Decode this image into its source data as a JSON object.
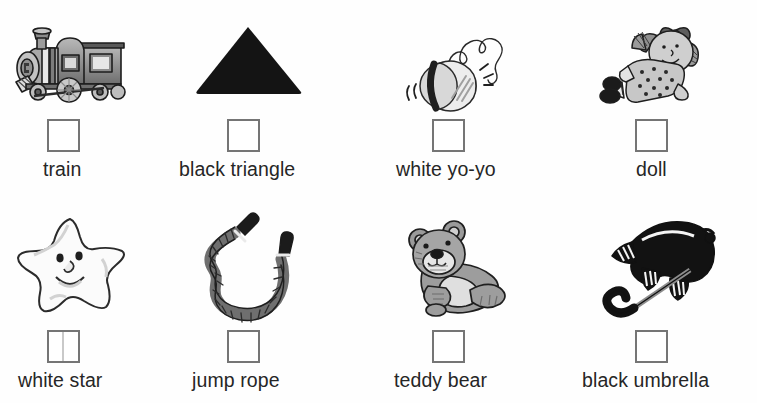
{
  "page": {
    "kind": "worksheet",
    "background_color": "#fefefe",
    "text_color": "#262626",
    "checkbox_border_color": "#757575",
    "columns": 4,
    "rows": 2
  },
  "items": [
    {
      "id": "train",
      "label": "train",
      "icon": "train-illustration",
      "checkbox_checked": false,
      "checkbox_state": "empty",
      "row": 1,
      "column": 1
    },
    {
      "id": "triangle",
      "label": "black triangle",
      "icon": "black-triangle-illustration",
      "checkbox_checked": false,
      "checkbox_state": "empty",
      "row": 1,
      "column": 2
    },
    {
      "id": "yoyo",
      "label": "white yo-yo",
      "icon": "white-yoyo-illustration",
      "checkbox_checked": false,
      "checkbox_state": "empty",
      "row": 1,
      "column": 3
    },
    {
      "id": "doll",
      "label": "doll",
      "icon": "doll-illustration",
      "checkbox_checked": false,
      "checkbox_state": "empty",
      "row": 1,
      "column": 4
    },
    {
      "id": "star",
      "label": "white star",
      "icon": "white-star-illustration",
      "checkbox_checked": false,
      "checkbox_state": "empty-with-vertical-line",
      "row": 2,
      "column": 1
    },
    {
      "id": "rope",
      "label": "jump rope",
      "icon": "jump-rope-illustration",
      "checkbox_checked": false,
      "checkbox_state": "empty",
      "row": 2,
      "column": 2
    },
    {
      "id": "bear",
      "label": "teddy bear",
      "icon": "teddy-bear-illustration",
      "checkbox_checked": false,
      "checkbox_state": "empty",
      "row": 2,
      "column": 3
    },
    {
      "id": "umbrella",
      "label": "black umbrella",
      "icon": "black-umbrella-illustration",
      "checkbox_checked": false,
      "checkbox_state": "empty",
      "row": 2,
      "column": 4
    }
  ]
}
